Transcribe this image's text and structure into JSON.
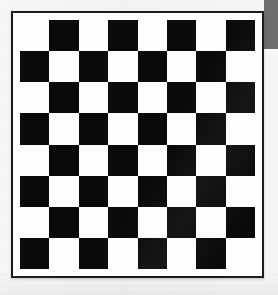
{
  "image": {
    "title": "Chessboard",
    "description": "Black and white 8x8 checkerboard pattern on a light background",
    "width": 278,
    "height": 295,
    "background_color": "#f4f4f4"
  },
  "corner_band": {
    "name": "gray band",
    "color": "#6e6e6e",
    "x": 264,
    "y": 0,
    "width": 14,
    "height": 49
  },
  "board": {
    "x": 11,
    "y": 11,
    "width": 253,
    "height": 267,
    "border_color": "#1c1c1c",
    "border_width": 2,
    "mat_color": "#fdfdfd",
    "mat_width": 7,
    "rows": 8,
    "columns": 8,
    "light_color": "#fdfdfd",
    "dark_color": "#0a0a0a",
    "top_left_square": "light",
    "bottom_right_square": "light",
    "squares": [
      [
        "light",
        "dark",
        "light",
        "dark",
        "light",
        "dark",
        "light",
        "dark"
      ],
      [
        "dark",
        "light",
        "dark",
        "light",
        "dark",
        "light",
        "dark",
        "light"
      ],
      [
        "light",
        "dark",
        "light",
        "dark",
        "light",
        "dark",
        "light",
        "dark"
      ],
      [
        "dark",
        "light",
        "dark",
        "light",
        "dark",
        "light",
        "dark",
        "light"
      ],
      [
        "light",
        "dark",
        "light",
        "dark",
        "light",
        "dark",
        "light",
        "dark"
      ],
      [
        "dark",
        "light",
        "dark",
        "light",
        "dark",
        "light",
        "dark",
        "light"
      ],
      [
        "light",
        "dark",
        "light",
        "dark",
        "light",
        "dark",
        "light",
        "dark"
      ],
      [
        "dark",
        "light",
        "dark",
        "light",
        "dark",
        "light",
        "dark",
        "light"
      ]
    ]
  }
}
